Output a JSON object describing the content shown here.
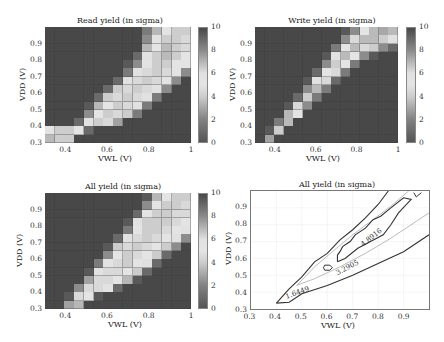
{
  "chart_data": [
    {
      "type": "heatmap",
      "title": "Read yield (in sigma)",
      "xlabel": "VWL (V)",
      "ylabel": "VDD (V)",
      "xticks": [
        "0.4",
        "0.6",
        "0.8",
        "1"
      ],
      "yticks": [
        "0.3",
        "0.4",
        "0.5",
        "0.6",
        "0.7",
        "0.8",
        "0.9"
      ],
      "xlim": [
        0.3,
        1.0
      ],
      "ylim": [
        0.3,
        1.0
      ],
      "colorbar": {
        "ticks": [
          "0",
          "2",
          "4",
          "6",
          "8",
          "10"
        ],
        "range": [
          0,
          10
        ]
      },
      "x": [
        0.3,
        0.35,
        0.4,
        0.45,
        0.5,
        0.55,
        0.6,
        0.65,
        0.7,
        0.75,
        0.8,
        0.85,
        0.9,
        0.95,
        1.0
      ],
      "y_top_to_bottom": [
        1.0,
        0.95,
        0.9,
        0.85,
        0.8,
        0.75,
        0.7,
        0.65,
        0.6,
        0.55,
        0.5,
        0.45,
        0.4,
        0.35
      ],
      "values": [
        [
          10,
          10,
          10,
          10,
          10,
          10,
          10,
          10,
          10,
          10,
          8.5,
          7,
          5,
          4,
          4
        ],
        [
          10,
          10,
          10,
          10,
          10,
          10,
          10,
          10,
          10,
          10,
          8,
          6,
          4,
          4,
          4.5
        ],
        [
          10,
          10,
          10,
          10,
          10,
          10,
          10,
          10,
          10,
          10,
          7,
          5,
          3.5,
          4,
          4.5
        ],
        [
          10,
          10,
          10,
          10,
          10,
          10,
          10,
          10,
          10,
          9,
          6,
          4,
          3.5,
          4,
          5
        ],
        [
          10,
          10,
          10,
          10,
          10,
          10,
          10,
          10,
          9.5,
          8,
          5.5,
          4,
          4,
          5,
          5.5
        ],
        [
          10,
          10,
          10,
          10,
          10,
          10,
          10,
          10,
          8.5,
          6,
          4.5,
          4,
          4.5,
          5.5,
          8
        ],
        [
          10,
          10,
          10,
          10,
          10,
          10,
          10,
          9,
          6,
          4.5,
          4,
          4.5,
          5.5,
          8,
          10
        ],
        [
          10,
          10,
          10,
          10,
          10,
          10,
          9,
          6.5,
          4.5,
          4,
          4.5,
          6,
          8,
          10,
          10
        ],
        [
          10,
          10,
          10,
          10,
          10,
          9,
          6.5,
          4.5,
          4,
          4.5,
          6,
          8.5,
          10,
          10,
          10
        ],
        [
          10,
          10,
          10,
          10,
          9.5,
          7,
          5,
          4,
          4.5,
          6,
          8.5,
          10,
          10,
          10,
          10
        ],
        [
          10,
          10,
          10,
          10,
          8,
          5,
          4,
          4.5,
          6.5,
          8.5,
          10,
          10,
          10,
          10,
          10
        ],
        [
          10,
          10,
          10,
          9,
          6,
          4,
          4.5,
          7.5,
          10,
          10,
          10,
          10,
          10,
          10,
          10
        ],
        [
          5,
          4,
          4,
          5,
          9,
          10,
          10,
          10,
          10,
          10,
          10,
          10,
          10,
          10,
          10
        ],
        [
          3.5,
          4,
          6.5,
          10,
          10,
          10,
          10,
          10,
          10,
          10,
          10,
          10,
          10,
          10,
          10
        ]
      ]
    },
    {
      "type": "heatmap",
      "title": "Write yield (in sigma)",
      "xlabel": "VWL (V)",
      "ylabel": "VDD (V)",
      "xticks": [
        "0.4",
        "0.6",
        "0.8",
        "1"
      ],
      "yticks": [
        "0.3",
        "0.4",
        "0.5",
        "0.6",
        "0.7",
        "0.8",
        "0.9"
      ],
      "xlim": [
        0.3,
        1.0
      ],
      "ylim": [
        0.3,
        1.0
      ],
      "colorbar": {
        "ticks": [
          "0",
          "2",
          "4",
          "6",
          "8",
          "10"
        ],
        "range": [
          0,
          10
        ]
      },
      "x": [
        0.3,
        0.35,
        0.4,
        0.45,
        0.5,
        0.55,
        0.6,
        0.65,
        0.7,
        0.75,
        0.8,
        0.85,
        0.9,
        0.95,
        1.0
      ],
      "y_top_to_bottom": [
        1.0,
        0.95,
        0.9,
        0.85,
        0.8,
        0.75,
        0.7,
        0.65,
        0.6,
        0.55,
        0.5,
        0.45,
        0.4,
        0.35
      ],
      "values": [
        [
          10,
          10,
          10,
          10,
          10,
          10,
          10,
          10,
          10,
          9.5,
          8,
          5,
          3.5,
          3,
          3.5
        ],
        [
          10,
          10,
          10,
          10,
          10,
          10,
          10,
          10,
          10,
          8,
          4.5,
          3.5,
          3.5,
          4,
          6
        ],
        [
          10,
          10,
          10,
          10,
          10,
          10,
          10,
          10,
          8.5,
          5,
          3.5,
          4.5,
          6.5,
          8,
          9
        ],
        [
          10,
          10,
          10,
          10,
          10,
          10,
          10,
          9.5,
          6,
          3.5,
          5,
          8,
          9.5,
          10,
          10
        ],
        [
          10,
          10,
          10,
          10,
          10,
          10,
          10,
          8,
          4,
          5,
          8.5,
          10,
          10,
          10,
          10
        ],
        [
          10,
          10,
          10,
          10,
          10,
          10,
          9,
          5,
          4.5,
          8.5,
          10,
          10,
          10,
          10,
          10
        ],
        [
          10,
          10,
          10,
          10,
          10,
          9.5,
          6,
          4.5,
          9,
          10,
          10,
          10,
          10,
          10,
          10
        ],
        [
          10,
          10,
          10,
          10,
          10,
          8,
          3.5,
          8.5,
          10,
          10,
          10,
          10,
          10,
          10,
          10
        ],
        [
          10,
          10,
          10,
          10,
          9,
          4,
          8.5,
          10,
          10,
          10,
          10,
          10,
          10,
          10,
          10
        ],
        [
          10,
          10,
          10,
          9.5,
          4.5,
          8,
          10,
          10,
          10,
          10,
          10,
          10,
          10,
          10,
          10
        ],
        [
          10,
          10,
          10,
          7,
          5,
          10,
          10,
          10,
          10,
          10,
          10,
          10,
          10,
          10,
          10
        ],
        [
          10,
          10,
          8.5,
          3.5,
          10,
          10,
          10,
          10,
          10,
          10,
          10,
          10,
          10,
          10,
          10
        ],
        [
          10,
          9.5,
          4,
          10,
          10,
          10,
          10,
          10,
          10,
          10,
          10,
          10,
          10,
          10,
          10
        ],
        [
          10,
          7.5,
          10,
          10,
          10,
          10,
          10,
          10,
          10,
          10,
          10,
          10,
          10,
          10,
          10
        ]
      ]
    },
    {
      "type": "heatmap",
      "title": "All yield (in sigma)",
      "xlabel": "VWL (V)",
      "ylabel": "VDD (V)",
      "xticks": [
        "0.4",
        "0.6",
        "0.8",
        "1"
      ],
      "yticks": [
        "0.3",
        "0.4",
        "0.5",
        "0.6",
        "0.7",
        "0.8",
        "0.9"
      ],
      "xlim": [
        0.3,
        1.0
      ],
      "ylim": [
        0.3,
        1.0
      ],
      "colorbar": {
        "ticks": [
          "0",
          "2",
          "4",
          "6",
          "8",
          "10"
        ],
        "range": [
          0,
          10
        ]
      },
      "x": [
        0.3,
        0.35,
        0.4,
        0.45,
        0.5,
        0.55,
        0.6,
        0.65,
        0.7,
        0.75,
        0.8,
        0.85,
        0.9,
        0.95,
        1.0
      ],
      "y_top_to_bottom": [
        1.0,
        0.95,
        0.9,
        0.85,
        0.8,
        0.75,
        0.7,
        0.65,
        0.6,
        0.55,
        0.5,
        0.45,
        0.4,
        0.35
      ],
      "values": [
        [
          10,
          10,
          10,
          10,
          10,
          10,
          10,
          10,
          10,
          10,
          9.5,
          7,
          5,
          4,
          4
        ],
        [
          10,
          10,
          10,
          10,
          10,
          10,
          10,
          10,
          10,
          10,
          8,
          5,
          4,
          4,
          4.5
        ],
        [
          10,
          10,
          10,
          10,
          10,
          10,
          10,
          10,
          10,
          9,
          5.5,
          4,
          4,
          4.5,
          4.5
        ],
        [
          10,
          10,
          10,
          10,
          10,
          10,
          10,
          10,
          9.5,
          6,
          4,
          4,
          4,
          4.5,
          5
        ],
        [
          10,
          10,
          10,
          10,
          10,
          10,
          10,
          10,
          8.5,
          5,
          4,
          4,
          4.5,
          5,
          6
        ],
        [
          10,
          10,
          10,
          10,
          10,
          10,
          10,
          9,
          6,
          4.5,
          4,
          4.5,
          5,
          6,
          8
        ],
        [
          10,
          10,
          10,
          10,
          10,
          10,
          9.5,
          6.5,
          4.5,
          4,
          4.5,
          5,
          6.5,
          8,
          10
        ],
        [
          10,
          10,
          10,
          10,
          10,
          10,
          8,
          5,
          4,
          4.5,
          5,
          6.5,
          9,
          10,
          10
        ],
        [
          10,
          10,
          10,
          10,
          10,
          8.5,
          5.5,
          4.5,
          4,
          5,
          6,
          9,
          10,
          10,
          10
        ],
        [
          10,
          10,
          10,
          10,
          9.5,
          6,
          4.5,
          4.5,
          5,
          6.5,
          9,
          10,
          10,
          10,
          10
        ],
        [
          10,
          10,
          10,
          10,
          7.5,
          4.5,
          4.5,
          5,
          7,
          9.5,
          10,
          10,
          10,
          10,
          10
        ],
        [
          10,
          10,
          10,
          8,
          4.5,
          4.5,
          5.5,
          9,
          10,
          10,
          10,
          10,
          10,
          10,
          10
        ],
        [
          10,
          10,
          9.5,
          4.5,
          5,
          9.5,
          10,
          10,
          10,
          10,
          10,
          10,
          10,
          10,
          10
        ],
        [
          10,
          10,
          7.5,
          7,
          10,
          10,
          10,
          10,
          10,
          10,
          10,
          10,
          10,
          10,
          10
        ]
      ]
    },
    {
      "type": "contour",
      "title": "All yield (in sigma)",
      "xlabel": "VWL (V)",
      "ylabel": "VDD (V)",
      "xticks": [
        "0.3",
        "0.4",
        "0.5",
        "0.6",
        "0.7",
        "0.8",
        "0.9"
      ],
      "yticks": [
        "0.3",
        "0.4",
        "0.5",
        "0.6",
        "0.7",
        "0.8",
        "0.9"
      ],
      "xlim": [
        0.3,
        1.0
      ],
      "ylim": [
        0.3,
        1.0
      ],
      "levels": [
        {
          "label": "1.6449",
          "color": "#333333",
          "outer": [
            [
              0.4,
              0.335
            ],
            [
              0.45,
              0.34
            ],
            [
              0.5,
              0.39
            ],
            [
              0.6,
              0.44
            ],
            [
              0.7,
              0.5
            ],
            [
              0.8,
              0.57
            ],
            [
              0.9,
              0.64
            ],
            [
              1.0,
              0.74
            ]
          ],
          "inner": [
            [
              0.4,
              0.335
            ],
            [
              0.45,
              0.42
            ],
            [
              0.5,
              0.49
            ],
            [
              0.55,
              0.58
            ],
            [
              0.6,
              0.63
            ],
            [
              0.65,
              0.71
            ],
            [
              0.7,
              0.77
            ],
            [
              0.75,
              0.84
            ],
            [
              0.8,
              0.92
            ],
            [
              0.84,
              1.0
            ]
          ]
        },
        {
          "label": "3.2905",
          "color": "#aaaaaa",
          "outer": [
            [
              0.48,
              0.44
            ],
            [
              0.55,
              0.48
            ],
            [
              0.65,
              0.55
            ],
            [
              0.75,
              0.63
            ],
            [
              0.85,
              0.72
            ],
            [
              0.95,
              0.82
            ],
            [
              1.0,
              0.87
            ]
          ],
          "inner": [
            [
              0.48,
              0.44
            ],
            [
              0.55,
              0.55
            ],
            [
              0.62,
              0.64
            ],
            [
              0.7,
              0.74
            ],
            [
              0.78,
              0.83
            ],
            [
              0.85,
              0.91
            ],
            [
              0.92,
              1.0
            ]
          ]
        },
        {
          "label": "4.8916",
          "color": "#333333",
          "path": [
            [
              0.64,
              0.58
            ],
            [
              0.67,
              0.6
            ],
            [
              0.72,
              0.66
            ],
            [
              0.77,
              0.7
            ],
            [
              0.82,
              0.74
            ],
            [
              0.85,
              0.8
            ],
            [
              0.88,
              0.87
            ],
            [
              0.93,
              0.95
            ],
            [
              0.9,
              0.96
            ],
            [
              0.85,
              0.9
            ],
            [
              0.81,
              0.85
            ],
            [
              0.78,
              0.83
            ],
            [
              0.75,
              0.78
            ],
            [
              0.71,
              0.74
            ],
            [
              0.69,
              0.7
            ],
            [
              0.66,
              0.67
            ],
            [
              0.65,
              0.64
            ],
            [
              0.64,
              0.62
            ],
            [
              0.64,
              0.58
            ]
          ]
        }
      ]
    }
  ],
  "panels": [
    {
      "title": "Read yield (in sigma)",
      "xlabel": "VWL (V)",
      "ylabel": "VDD (V)"
    },
    {
      "title": "Write yield (in sigma)",
      "xlabel": "VWL (V)",
      "ylabel": "VDD (V)"
    },
    {
      "title": "All yield (in sigma)",
      "xlabel": "VWL (V)",
      "ylabel": "VDD (V)"
    },
    {
      "title": "All yield (in sigma)",
      "xlabel": "VWL (V)",
      "ylabel": "VDD (V)"
    }
  ],
  "contour_labels": [
    "1.6449",
    "3.2905",
    "4.8916"
  ]
}
